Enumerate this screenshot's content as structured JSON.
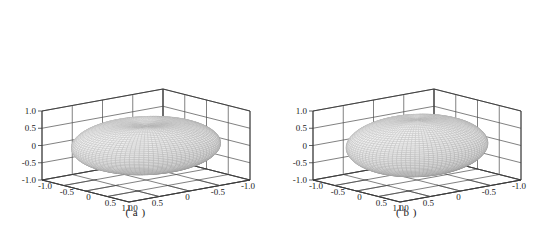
{
  "figure": {
    "panels": [
      {
        "id": "a",
        "caption": "( a )",
        "axes": {
          "z_ticks": [
            "1.0",
            "0.5",
            "0",
            "-0.5",
            "-1.0"
          ],
          "x_ticks": [
            "1.0",
            "0.5",
            "0",
            "-0.5",
            "-1.0"
          ],
          "y_ticks": [
            "-1.0",
            "-0.5",
            "0",
            "0.5",
            "1.0"
          ]
        }
      },
      {
        "id": "b",
        "caption": "( b )",
        "axes": {
          "z_ticks": [
            "1.0",
            "0.5",
            "0",
            "-0.5",
            "-1.0"
          ],
          "x_ticks": [
            "1.0",
            "0.5",
            "0",
            "-0.5",
            "-1.0"
          ],
          "y_ticks": [
            "-1.0",
            "-0.5",
            "0",
            "0.5",
            "1.0"
          ]
        }
      }
    ]
  },
  "chart_data": [
    {
      "type": "surface",
      "title": "( a )",
      "xlabel": "",
      "ylabel": "",
      "zlabel": "",
      "xlim": [
        -1.0,
        1.0
      ],
      "ylim": [
        -1.0,
        1.0
      ],
      "zlim": [
        -1.0,
        1.0
      ],
      "xticks": [
        1.0,
        0.5,
        0,
        -0.5,
        -1.0
      ],
      "yticks": [
        -1.0,
        -0.5,
        0,
        0.5,
        1.0
      ],
      "zticks": [
        1.0,
        0.5,
        0,
        -0.5,
        -1.0
      ],
      "grid": true,
      "legend": "none",
      "description": "3D mesh surface: flattened oblate torus-like body centred at origin, radius approx 1.0 in x and y, vertical half-height approx 0.7, with a shallow circular dimple depression on the top pole around z = 0.45",
      "surface": {
        "shape": "oblate-dimpled-spheroid",
        "equatorial_radius": 1.0,
        "polar_half_height": 0.72,
        "top_dimple_depth": 0.16,
        "top_dimple_radius": 0.38,
        "mesh_color": "#9a9a9a",
        "fill_color": "#f2f2f2"
      },
      "view": {
        "azimuth_deg": -45,
        "elevation_deg": 22
      }
    },
    {
      "type": "surface",
      "title": "( b )",
      "xlabel": "",
      "ylabel": "",
      "zlabel": "",
      "xlim": [
        -1.0,
        1.0
      ],
      "ylim": [
        -1.0,
        1.0
      ],
      "zlim": [
        -1.0,
        1.0
      ],
      "xticks": [
        1.0,
        0.5,
        0,
        -0.5,
        -1.0
      ],
      "yticks": [
        -1.0,
        -0.5,
        0,
        0.5,
        1.0
      ],
      "zticks": [
        1.0,
        0.5,
        0,
        -0.5,
        -1.0
      ],
      "grid": true,
      "legend": "none",
      "description": "3D mesh surface: rounder oblate spheroid centred at origin, radius approx 0.95 in x and y, vertical half-height approx 0.80, with only a very faint dimple at the top pole near z = 0.72",
      "surface": {
        "shape": "oblate-spheroid",
        "equatorial_radius": 0.95,
        "polar_half_height": 0.8,
        "top_dimple_depth": 0.05,
        "top_dimple_radius": 0.25,
        "mesh_color": "#9a9a9a",
        "fill_color": "#f2f2f2"
      },
      "view": {
        "azimuth_deg": -45,
        "elevation_deg": 22
      }
    }
  ],
  "colors": {
    "axis_line": "#3a3a3a",
    "grid_line": "#4a4a4a",
    "text": "#1a1a1a",
    "background": "#ffffff",
    "mesh": "#9a9a9a"
  }
}
